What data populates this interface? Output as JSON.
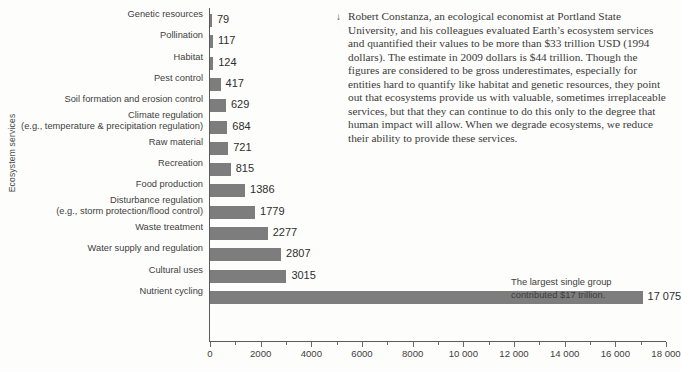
{
  "chart_data": {
    "type": "bar",
    "orientation": "horizontal",
    "title": "",
    "xlabel": "",
    "ylabel": "Ecosystem services",
    "xlim": [
      0,
      18000
    ],
    "grid": false,
    "legend": null,
    "bar_color": "#7d7d7d",
    "axis_color": "#5b5b5b",
    "xticks": [
      {
        "value": 0,
        "label": "0",
        "type": "major"
      },
      {
        "value": 1000,
        "label": "",
        "type": "minor"
      },
      {
        "value": 2000,
        "label": "2000",
        "type": "major"
      },
      {
        "value": 3000,
        "label": "",
        "type": "minor"
      },
      {
        "value": 4000,
        "label": "4000",
        "type": "major"
      },
      {
        "value": 5000,
        "label": "",
        "type": "minor"
      },
      {
        "value": 6000,
        "label": "6000",
        "type": "major"
      },
      {
        "value": 7000,
        "label": "",
        "type": "minor"
      },
      {
        "value": 8000,
        "label": "8000",
        "type": "major"
      },
      {
        "value": 9000,
        "label": "",
        "type": "minor"
      },
      {
        "value": 10000,
        "label": "10 000",
        "type": "major"
      },
      {
        "value": 11000,
        "label": "",
        "type": "minor"
      },
      {
        "value": 12000,
        "label": "12 000",
        "type": "major"
      },
      {
        "value": 13000,
        "label": "",
        "type": "minor"
      },
      {
        "value": 14000,
        "label": "14 000",
        "type": "major"
      },
      {
        "value": 15000,
        "label": "",
        "type": "minor"
      },
      {
        "value": 16000,
        "label": "16 000",
        "type": "major"
      },
      {
        "value": 17000,
        "label": "",
        "type": "minor"
      },
      {
        "value": 18000,
        "label": "18 000",
        "type": "major"
      }
    ],
    "categories": [
      "Genetic resources",
      "Pollination",
      "Habitat",
      "Pest control",
      "Soil formation and erosion control",
      "Climate regulation\n(e.g., temperature & precipitation regulation)",
      "Raw material",
      "Recreation",
      "Food production",
      "Disturbance regulation\n(e.g., storm protection/flood control)",
      "Waste treatment",
      "Water supply and regulation",
      "Cultural uses",
      "Nutrient cycling"
    ],
    "values": [
      79,
      117,
      124,
      417,
      629,
      684,
      721,
      815,
      1386,
      1779,
      2277,
      2807,
      3015,
      17075
    ],
    "value_labels": [
      "79",
      "117",
      "124",
      "417",
      "629",
      "684",
      "721",
      "815",
      "1386",
      "1779",
      "2277",
      "2807",
      "3015",
      "17 075"
    ],
    "bars": [
      {
        "label_line1": "Genetic resources",
        "label_line2": "",
        "value": 79,
        "value_label": "79"
      },
      {
        "label_line1": "Pollination",
        "label_line2": "",
        "value": 117,
        "value_label": "117"
      },
      {
        "label_line1": "Habitat",
        "label_line2": "",
        "value": 124,
        "value_label": "124"
      },
      {
        "label_line1": "Pest control",
        "label_line2": "",
        "value": 417,
        "value_label": "417"
      },
      {
        "label_line1": "Soil formation and erosion control",
        "label_line2": "",
        "value": 629,
        "value_label": "629"
      },
      {
        "label_line1": "Climate regulation",
        "label_line2": "(e.g., temperature & precipitation regulation)",
        "value": 684,
        "value_label": "684"
      },
      {
        "label_line1": "Raw material",
        "label_line2": "",
        "value": 721,
        "value_label": "721"
      },
      {
        "label_line1": "Recreation",
        "label_line2": "",
        "value": 815,
        "value_label": "815"
      },
      {
        "label_line1": "Food production",
        "label_line2": "",
        "value": 1386,
        "value_label": "1386"
      },
      {
        "label_line1": "Disturbance regulation",
        "label_line2": "(e.g., storm protection/flood control)",
        "value": 1779,
        "value_label": "1779"
      },
      {
        "label_line1": "Waste treatment",
        "label_line2": "",
        "value": 2277,
        "value_label": "2277"
      },
      {
        "label_line1": "Water supply and regulation",
        "label_line2": "",
        "value": 2807,
        "value_label": "2807"
      },
      {
        "label_line1": "Cultural uses",
        "label_line2": "",
        "value": 3015,
        "value_label": "3015"
      },
      {
        "label_line1": "Nutrient cycling",
        "label_line2": "",
        "value": 17075,
        "value_label": "17 075"
      }
    ],
    "annotation": {
      "line1": "The largest single group",
      "line2": "contributed $17 trillion."
    }
  },
  "caption": {
    "marker": "↓",
    "text": "Robert Constanza, an ecological economist at Portland State University, and his colleagues evaluated Earth’s ecosystem services and quantified their values to be more than $33 trillion USD (1994 dollars). The estimate in 2009 dollars is $44 trillion. Though the figures are considered to be gross underestimates, especially for entities hard to quantify like habitat and genetic resources, they point out that ecosystems provide us with valuable, sometimes irreplaceable services, but that they can continue to do this only to the degree that human impact will allow. When we degrade ecosystems, we reduce their ability to provide these services."
  }
}
